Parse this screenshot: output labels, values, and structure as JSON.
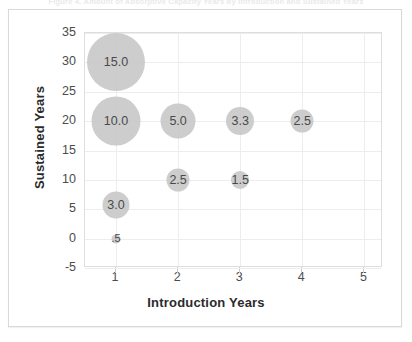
{
  "figure": {
    "title": "Figure 4. Amount of Absorptive Capacity Years by Introduction and Sustained Years"
  },
  "chart_data": {
    "type": "scatter",
    "title": "",
    "xlabel": "Introduction Years",
    "ylabel": "Sustained Years",
    "xlim": [
      0.5,
      5.3
    ],
    "ylim": [
      -5,
      35
    ],
    "xticks": [
      "1",
      "2",
      "3",
      "4",
      "5"
    ],
    "xtick_values": [
      1,
      2,
      3,
      4,
      5
    ],
    "yticks": [
      "35",
      "30",
      "25",
      "20",
      "15",
      "10",
      "5",
      "0",
      "-5"
    ],
    "ytick_values": [
      35,
      30,
      25,
      20,
      15,
      10,
      5,
      0,
      -5
    ],
    "grid": true,
    "legend": "none",
    "bubble_color": "#c9c9c9",
    "points": [
      {
        "x": 1,
        "y": 30,
        "label": "15.0",
        "size": 15.0,
        "diameter_px": 58
      },
      {
        "x": 1,
        "y": 20,
        "label": "10.0",
        "size": 10.0,
        "diameter_px": 49
      },
      {
        "x": 2,
        "y": 20,
        "label": "5.0",
        "size": 5.0,
        "diameter_px": 35
      },
      {
        "x": 3,
        "y": 20,
        "label": "3.3",
        "size": 3.3,
        "diameter_px": 28
      },
      {
        "x": 4,
        "y": 20,
        "label": "2.5",
        "size": 2.5,
        "diameter_px": 23
      },
      {
        "x": 2,
        "y": 10,
        "label": "2.5",
        "size": 2.5,
        "diameter_px": 23
      },
      {
        "x": 3,
        "y": 10,
        "label": "1.5",
        "size": 1.5,
        "diameter_px": 18
      },
      {
        "x": 1,
        "y": 5.8,
        "label": "3.0",
        "size": 3.0,
        "diameter_px": 27
      },
      {
        "x": 1,
        "y": 0,
        "label": ".5",
        "size": 0.5,
        "diameter_px": 9
      }
    ]
  }
}
